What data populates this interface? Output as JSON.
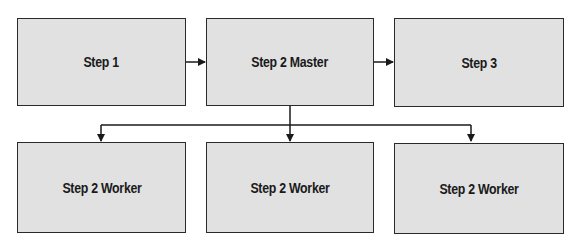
{
  "diagram": {
    "top_row": [
      {
        "id": "step1",
        "label": "Step 1"
      },
      {
        "id": "step2-master",
        "label": "Step 2 Master"
      },
      {
        "id": "step3",
        "label": "Step 3"
      }
    ],
    "bottom_row": [
      {
        "id": "worker1",
        "label": "Step 2 Worker"
      },
      {
        "id": "worker2",
        "label": "Step 2 Worker"
      },
      {
        "id": "worker3",
        "label": "Step 2 Worker"
      }
    ],
    "edges": [
      {
        "from": "step1",
        "to": "step2-master"
      },
      {
        "from": "step2-master",
        "to": "step3"
      },
      {
        "from": "step2-master",
        "to": "worker1"
      },
      {
        "from": "step2-master",
        "to": "worker2"
      },
      {
        "from": "step2-master",
        "to": "worker3"
      }
    ],
    "colors": {
      "box_fill": "#e1e1e1",
      "stroke": "#2a2a2a"
    }
  }
}
